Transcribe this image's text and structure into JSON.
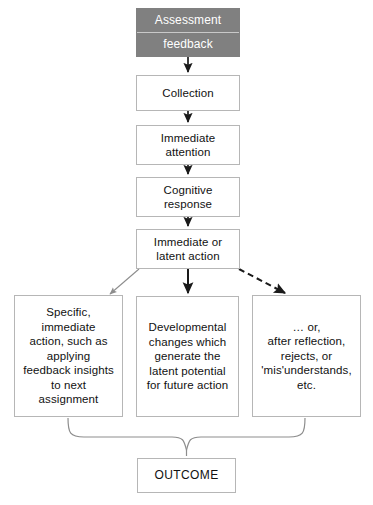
{
  "diagram": {
    "colors": {
      "header_fill": "#808080",
      "header_text": "#ffffff",
      "box_border": "#b6b6b6",
      "box_fill": "#ffffff",
      "text": "#111111",
      "solid_arrow": "#1a1a1a",
      "gray_arrow": "#8d8d8d",
      "dashed_arrow": "#1a1a1a",
      "brace": "#8d8d8d"
    },
    "nodes": {
      "assessment_feedback": {
        "line1": "Assessment",
        "line2": "feedback"
      },
      "collection": {
        "lines": [
          "Collection"
        ]
      },
      "immediate_attention": {
        "lines": [
          "Immediate",
          "attention"
        ]
      },
      "cognitive_response": {
        "lines": [
          "Cognitive",
          "response"
        ]
      },
      "immediate_latent_action": {
        "lines": [
          "Immediate or",
          "latent action"
        ]
      },
      "specific_action": {
        "lines": [
          "Specific,",
          "immediate",
          "action, such as",
          "applying",
          "feedback insights",
          "to next",
          "assignment"
        ]
      },
      "developmental_changes": {
        "lines": [
          "Developmental",
          "changes which",
          "generate the",
          "latent potential",
          "for future action"
        ]
      },
      "reflection_rejects": {
        "lines": [
          "… or,",
          "after reflection,",
          "rejects, or",
          "'mis'understands,",
          "etc."
        ]
      },
      "outcome": {
        "lines": [
          "OUTCOME"
        ]
      }
    },
    "connectors": [
      {
        "name": "assessment-to-collection",
        "style": "solid",
        "color": "#1a1a1a"
      },
      {
        "name": "collection-to-immediate-attention",
        "style": "solid",
        "color": "#1a1a1a"
      },
      {
        "name": "immediate-attention-to-cognitive-response",
        "style": "solid",
        "color": "#1a1a1a"
      },
      {
        "name": "cognitive-response-to-immediate-latent",
        "style": "solid",
        "color": "#1a1a1a"
      },
      {
        "name": "immediate-latent-to-specific-action",
        "style": "solid-thin",
        "color": "#8d8d8d"
      },
      {
        "name": "immediate-latent-to-developmental-changes",
        "style": "solid",
        "color": "#1a1a1a"
      },
      {
        "name": "immediate-latent-to-reflection-rejects",
        "style": "dashed",
        "color": "#1a1a1a"
      },
      {
        "name": "three-boxes-brace-to-outcome",
        "style": "curly-brace",
        "color": "#8d8d8d"
      }
    ]
  }
}
